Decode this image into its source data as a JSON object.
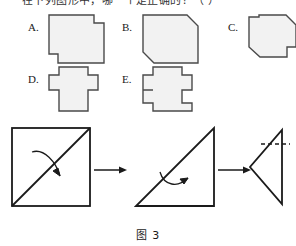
{
  "caption": "图 3",
  "stem": {
    "text": "在下列图形中，哪一个是正确的？（     ）"
  },
  "options": [
    {
      "id": "A",
      "label": "A.",
      "shape_name": "square-with-two-step-notches",
      "description": "正方形，右上角与左下角各有一个方形缺口"
    },
    {
      "id": "B",
      "label": "B.",
      "shape_name": "square-with-two-chamfered-corners",
      "description": "正方形，右上角与左下角被斜切"
    },
    {
      "id": "C",
      "label": "C.",
      "shape_name": "square-chamfered-with-side-notches",
      "description": "正方形，右上与左下斜切，左上与右下各有方形缺口"
    },
    {
      "id": "D",
      "label": "D.",
      "shape_name": "square-with-three-tabs",
      "description": "正方形，上、左、右三边各有一个凸出方块"
    },
    {
      "id": "E",
      "label": "E.",
      "shape_name": "cross-square-with-four-tabs",
      "description": "正方形，上、下、左、右四边各有一个凸出方块"
    }
  ],
  "process": {
    "steps": [
      {
        "id": "step-1",
        "name": "square-with-diagonal-fold",
        "caption": "",
        "fold_hint": "沿对角线对折"
      },
      {
        "id": "step-2",
        "name": "triangle-second-fold",
        "caption": "",
        "fold_hint": "再次对折"
      },
      {
        "id": "step-3",
        "name": "folded-triangle-with-cut-line",
        "caption": "",
        "fold_hint": "沿虚线剪开"
      }
    ],
    "arrows": [
      {
        "id": "arrow-1",
        "name": "right-arrow"
      },
      {
        "id": "arrow-2",
        "name": "right-arrow"
      }
    ],
    "cut_line_style": "dashed"
  },
  "colors": {
    "stroke": "#4a4a4a",
    "fill": "#f2f2f2",
    "dark_stroke": "#1a1a1a",
    "background": "#ffffff"
  }
}
